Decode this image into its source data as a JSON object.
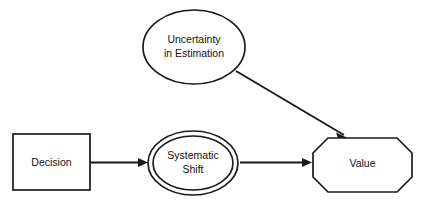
{
  "diagram": {
    "background_color": "#ffffff",
    "stroke_color": "#1a1a1a",
    "text_color": "#111111",
    "nodes": [
      {
        "id": "decision",
        "shape": "rectangle",
        "label": "Decision",
        "lines": [
          "Decision"
        ],
        "x": 13,
        "y": 134,
        "width": 77,
        "height": 56
      },
      {
        "id": "systematic-shift",
        "shape": "double-ellipse",
        "label": "Systematic Shift",
        "lines": [
          "Systematic",
          "Shift"
        ],
        "cx": 193,
        "cy": 163,
        "rx": 45,
        "ry": 32
      },
      {
        "id": "value",
        "shape": "octagon",
        "label": "Value",
        "lines": [
          "Value"
        ],
        "x": 313,
        "y": 138,
        "width": 99,
        "height": 54
      },
      {
        "id": "uncertainty-in-estimation",
        "shape": "ellipse",
        "label": "Uncertainty in Estimation",
        "lines": [
          "Uncertainty",
          "in Estimation"
        ],
        "cx": 194,
        "cy": 47,
        "rx": 51,
        "ry": 37
      }
    ],
    "edges": [
      {
        "id": "decision-to-systematic-shift",
        "from": "decision",
        "to": "systematic-shift",
        "style": "solid-arrow",
        "direction": "horizontal"
      },
      {
        "id": "systematic-shift-to-value",
        "from": "systematic-shift",
        "to": "value",
        "style": "solid-arrow",
        "direction": "horizontal"
      },
      {
        "id": "uncertainty-to-value",
        "from": "uncertainty-in-estimation",
        "to": "value",
        "style": "solid-arrow",
        "direction": "diagonal"
      }
    ]
  }
}
